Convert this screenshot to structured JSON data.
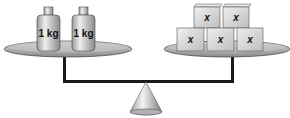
{
  "diagram": {
    "type": "balance-scale",
    "state": "balanced",
    "left_pan": {
      "items": [
        {
          "kind": "weight",
          "label": "1 kg"
        },
        {
          "kind": "weight",
          "label": "1 kg"
        }
      ]
    },
    "right_pan": {
      "items": [
        {
          "kind": "cube",
          "label": "x"
        },
        {
          "kind": "cube",
          "label": "x"
        },
        {
          "kind": "cube",
          "label": "x"
        },
        {
          "kind": "cube",
          "label": "x"
        },
        {
          "kind": "cube",
          "label": "x"
        }
      ]
    },
    "colors": {
      "pan": "#b8b8b8",
      "beam": "#1a1a1a",
      "weight": "#cfcfcf",
      "cube": "#d4d4d4"
    }
  }
}
